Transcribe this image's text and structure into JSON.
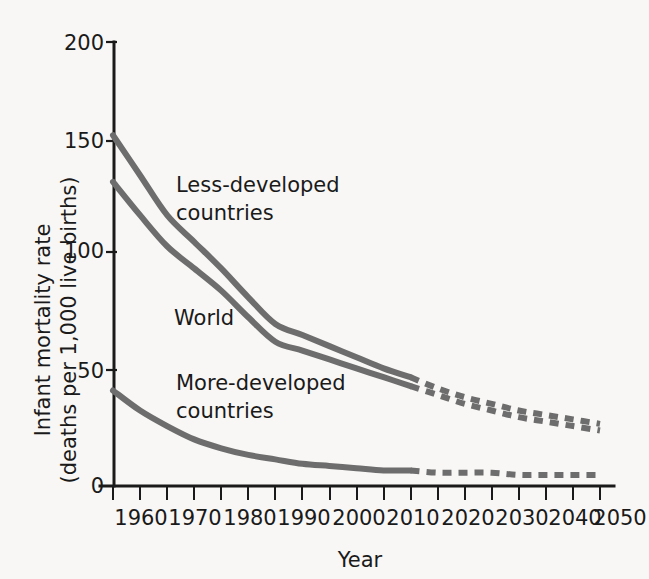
{
  "chart_data": {
    "type": "line",
    "title": "",
    "xlabel": "Year",
    "ylabel": "Infant mortality rate (deaths per 1,000 live births)",
    "ylabel_line1": "Infant mortality rate",
    "ylabel_line2": "(deaths per 1,000 live births)",
    "xlim": [
      1960,
      2050
    ],
    "ylim": [
      0,
      200
    ],
    "grid": false,
    "legend_position": "inline-annotations",
    "x_ticks": [
      1960,
      1970,
      1980,
      1990,
      2000,
      2010,
      2020,
      2030,
      2040,
      2050
    ],
    "x_tick_labels": [
      "1960",
      "1970",
      "1980",
      "1990",
      "2000",
      "2010",
      "2020",
      "2030",
      "2040",
      "2050"
    ],
    "x_minor_tick_interval": 5,
    "y_ticks": [
      0,
      50,
      100,
      150,
      200
    ],
    "y_tick_labels": [
      "0",
      "50",
      "100",
      "150",
      "200"
    ],
    "projection_start_year": 2015,
    "series": [
      {
        "name": "Less-developed countries",
        "label": "Less-developed countries",
        "label_line1": "Less-developed",
        "label_line2": "countries",
        "color": "#6d6d6d",
        "x": [
          1960,
          1965,
          1970,
          1975,
          1980,
          1985,
          1990,
          1995,
          2000,
          2005,
          2010,
          2015,
          2020,
          2025,
          2030,
          2035,
          2040,
          2045,
          2050
        ],
        "values": [
          158,
          140,
          122,
          110,
          98,
          85,
          73,
          68,
          63,
          58,
          53,
          49,
          44,
          40,
          37,
          34,
          32,
          30,
          28
        ],
        "solid_until_year": 2015
      },
      {
        "name": "World",
        "label": "World",
        "color": "#6d6d6d",
        "x": [
          1960,
          1965,
          1970,
          1975,
          1980,
          1985,
          1990,
          1995,
          2000,
          2005,
          2010,
          2015,
          2020,
          2025,
          2030,
          2035,
          2040,
          2045,
          2050
        ],
        "values": [
          137,
          122,
          108,
          98,
          88,
          76,
          65,
          61,
          57,
          53,
          49,
          45,
          41,
          37,
          34,
          31,
          29,
          27,
          25
        ],
        "solid_until_year": 2015
      },
      {
        "name": "More-developed countries",
        "label": "More-developed countries",
        "label_line1": "More-developed",
        "label_line2": "countries",
        "color": "#6d6d6d",
        "x": [
          1960,
          1965,
          1970,
          1975,
          1980,
          1985,
          1990,
          1995,
          2000,
          2005,
          2010,
          2015,
          2020,
          2025,
          2030,
          2035,
          2040,
          2045,
          2050
        ],
        "values": [
          43,
          34,
          27,
          21,
          17,
          14,
          12,
          10,
          9,
          8,
          7,
          7,
          6,
          6,
          6,
          5,
          5,
          5,
          5
        ],
        "solid_until_year": 2015
      }
    ]
  },
  "annotations": {
    "less_developed": {
      "line1": "Less-developed",
      "line2": "countries"
    },
    "world": {
      "line1": "World"
    },
    "more_developed": {
      "line1": "More-developed",
      "line2": "countries"
    }
  },
  "colors": {
    "line": "#6d6d6d",
    "axis": "#1a1a1a",
    "background": "#f8f7f5",
    "text": "#1a1a1a"
  }
}
